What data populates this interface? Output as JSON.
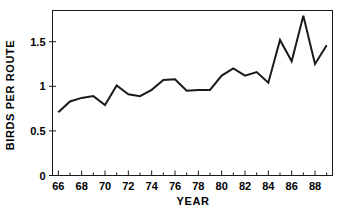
{
  "chart_data": {
    "type": "line",
    "title": "",
    "xlabel": "YEAR",
    "ylabel": "BIRDS PER ROUTE",
    "xlim": [
      65.5,
      89.5
    ],
    "ylim": [
      0,
      1.85
    ],
    "grid": false,
    "legend": null,
    "x": [
      66,
      67,
      68,
      69,
      70,
      71,
      72,
      73,
      74,
      75,
      76,
      77,
      78,
      79,
      80,
      81,
      82,
      83,
      84,
      85,
      86,
      87,
      88,
      89
    ],
    "values": [
      0.71,
      0.83,
      0.87,
      0.89,
      0.79,
      1.01,
      0.91,
      0.89,
      0.96,
      1.07,
      1.08,
      0.95,
      0.96,
      0.96,
      1.12,
      1.2,
      1.12,
      1.16,
      1.04,
      1.52,
      1.28,
      1.79,
      1.25,
      1.46
    ],
    "series": [
      {
        "name": "Birds per route",
        "values": [
          0.71,
          0.83,
          0.87,
          0.89,
          0.79,
          1.01,
          0.91,
          0.89,
          0.96,
          1.07,
          1.08,
          0.95,
          0.96,
          0.96,
          1.12,
          1.2,
          1.12,
          1.16,
          1.04,
          1.52,
          1.28,
          1.79,
          1.25,
          1.46
        ]
      }
    ],
    "y_ticks": [
      0,
      0.5,
      1,
      1.5
    ],
    "y_tick_labels": [
      "0",
      "0.5",
      "1",
      "1.5"
    ],
    "x_ticks_major": [
      66,
      68,
      70,
      72,
      74,
      76,
      78,
      80,
      82,
      84,
      86,
      88
    ],
    "x_tick_labels": [
      "66",
      "68",
      "70",
      "72",
      "74",
      "76",
      "78",
      "80",
      "82",
      "84",
      "86",
      "88"
    ],
    "x_ticks_minor": [
      67,
      69,
      71,
      73,
      75,
      77,
      79,
      81,
      83,
      85,
      87,
      89
    ],
    "line_color": "#1a1a1a",
    "axis_color": "#1a1a1a",
    "background_color": "#ffffff"
  }
}
